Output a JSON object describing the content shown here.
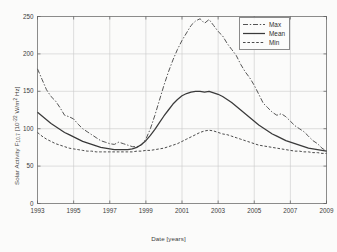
{
  "chart_data": {
    "type": "line",
    "title": "",
    "xlabel": "Date [years]",
    "ylabel": "Solar Activity F10.7 [10^-22 W/m^2 Hz]",
    "ylabel_parts": {
      "prefix": "Solar Activity F",
      "sub": "10.7",
      "mid": " [10",
      "sup": "-22",
      "suffix": " W/m",
      "sup2": "2",
      "tail": " Hz]"
    },
    "xlim": [
      1993,
      2009
    ],
    "ylim": [
      0,
      250
    ],
    "xticks": [
      1993,
      1995,
      1997,
      1999,
      2001,
      2003,
      2005,
      2007,
      2009
    ],
    "xtick_labels": [
      "1993",
      "1995",
      "1997",
      "1999",
      "2001",
      "2003",
      "2005",
      "2007",
      "2009"
    ],
    "yticks": [
      0,
      50,
      100,
      150,
      200,
      250
    ],
    "ytick_labels": [
      "0",
      "50",
      "100",
      "150",
      "200",
      "250"
    ],
    "grid": true,
    "legend_position": "top-right",
    "legend": [
      "Max",
      "Mean",
      "Min"
    ],
    "x": [
      1993.0,
      1993.25,
      1993.5,
      1993.75,
      1994.0,
      1994.25,
      1994.5,
      1994.75,
      1995.0,
      1995.25,
      1995.5,
      1995.75,
      1996.0,
      1996.25,
      1996.5,
      1996.75,
      1997.0,
      1997.25,
      1997.5,
      1997.75,
      1998.0,
      1998.25,
      1998.5,
      1998.75,
      1999.0,
      1999.25,
      1999.5,
      1999.75,
      2000.0,
      2000.25,
      2000.5,
      2000.75,
      2001.0,
      2001.25,
      2001.5,
      2001.75,
      2002.0,
      2002.25,
      2002.5,
      2002.75,
      2003.0,
      2003.25,
      2003.5,
      2003.75,
      2004.0,
      2004.25,
      2004.5,
      2004.75,
      2005.0,
      2005.25,
      2005.5,
      2005.75,
      2006.0,
      2006.25,
      2006.5,
      2006.75,
      2007.0,
      2007.25,
      2007.5,
      2007.75,
      2008.0,
      2008.25,
      2008.5,
      2008.75,
      2009.0
    ],
    "series": [
      {
        "name": "Max",
        "style": "dash-dot",
        "color": "#555555",
        "values": [
          180,
          166,
          152,
          143,
          137,
          128,
          118,
          116,
          113,
          106,
          100,
          96,
          92,
          88,
          84,
          82,
          80,
          79,
          82,
          80,
          78,
          76,
          76,
          78,
          86,
          100,
          118,
          138,
          158,
          176,
          192,
          206,
          218,
          228,
          238,
          244,
          247,
          241,
          246,
          238,
          230,
          224,
          214,
          206,
          198,
          186,
          176,
          168,
          158,
          146,
          134,
          128,
          122,
          118,
          120,
          116,
          110,
          104,
          100,
          96,
          90,
          84,
          80,
          74,
          70
        ]
      },
      {
        "name": "Mean",
        "style": "solid",
        "color": "#3a3a3a",
        "values": [
          122,
          117,
          112,
          107,
          103,
          99,
          95,
          92,
          89,
          86,
          83,
          81,
          79,
          77,
          75,
          74,
          73,
          72,
          72,
          72,
          72,
          73,
          75,
          79,
          84,
          91,
          99,
          108,
          117,
          125,
          133,
          139,
          144,
          147,
          149,
          150,
          150,
          149,
          150,
          148,
          146,
          143,
          139,
          135,
          130,
          125,
          120,
          115,
          110,
          105,
          101,
          97,
          93,
          90,
          87,
          84,
          82,
          80,
          78,
          76,
          74,
          73,
          72,
          71,
          70
        ]
      },
      {
        "name": "Min",
        "style": "dashed",
        "color": "#4a4a4a",
        "values": [
          95,
          90,
          86,
          83,
          80,
          78,
          76,
          74,
          73,
          72,
          71,
          70,
          70,
          69,
          69,
          69,
          69,
          69,
          69,
          69,
          69,
          69,
          70,
          70,
          71,
          71,
          72,
          73,
          74,
          76,
          78,
          80,
          83,
          86,
          89,
          92,
          95,
          97,
          98,
          97,
          95,
          93,
          92,
          90,
          88,
          86,
          84,
          82,
          80,
          78,
          77,
          76,
          75,
          74,
          73,
          72,
          71,
          70,
          70,
          69,
          69,
          68,
          68,
          67,
          67
        ]
      }
    ]
  }
}
